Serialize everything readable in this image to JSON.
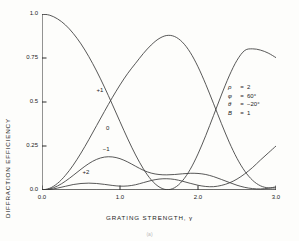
{
  "figure": {
    "caption": "(a)"
  },
  "chart_data": {
    "type": "line",
    "title": "",
    "xlabel": "GRATING STRENGTH, γ",
    "ylabel": "DIFFRACTION EFFICIENCY",
    "xlim": [
      0.0,
      3.0
    ],
    "ylim": [
      0.0,
      1.0
    ],
    "xticks": [
      0.0,
      1.0,
      2.0,
      3.0
    ],
    "xtick_labels": [
      "0.0",
      "1.0",
      "2.0",
      "3.0"
    ],
    "yticks": [
      0.0,
      0.25,
      0.5,
      0.75,
      1.0
    ],
    "ytick_labels": [
      "0.0",
      "0.25",
      "0.5",
      "0.75",
      "1.0"
    ],
    "grid": false,
    "legend_position": "none",
    "x": [
      0.0,
      0.1,
      0.2,
      0.3,
      0.4,
      0.5,
      0.6,
      0.7,
      0.8,
      0.9,
      1.0,
      1.1,
      1.2,
      1.3,
      1.4,
      1.5,
      1.6,
      1.7,
      1.8,
      1.9,
      2.0,
      2.1,
      2.2,
      2.3,
      2.4,
      2.5,
      2.6,
      2.7,
      2.8,
      2.9,
      3.0
    ],
    "series": [
      {
        "name": "0",
        "label": "0",
        "label_x": 0.82,
        "label_y": 0.345,
        "values": [
          1.0,
          0.993,
          0.972,
          0.938,
          0.89,
          0.83,
          0.758,
          0.676,
          0.585,
          0.488,
          0.388,
          0.29,
          0.199,
          0.12,
          0.058,
          0.018,
          0.002,
          0.013,
          0.052,
          0.117,
          0.205,
          0.31,
          0.424,
          0.54,
          0.648,
          0.737,
          0.793,
          0.802,
          0.795,
          0.778,
          0.752
        ]
      },
      {
        "name": "+1",
        "label": "+1",
        "label_x": 0.7,
        "label_y": 0.565,
        "values": [
          0.0,
          0.01,
          0.038,
          0.083,
          0.141,
          0.21,
          0.286,
          0.366,
          0.446,
          0.524,
          0.597,
          0.663,
          0.72,
          0.776,
          0.824,
          0.86,
          0.878,
          0.872,
          0.84,
          0.782,
          0.7,
          0.6,
          0.49,
          0.378,
          0.272,
          0.18,
          0.107,
          0.055,
          0.024,
          0.012,
          0.012
        ]
      },
      {
        "name": "-1",
        "label": "−1",
        "label_x": 0.78,
        "label_y": 0.225,
        "values": [
          0.0,
          0.006,
          0.023,
          0.05,
          0.083,
          0.118,
          0.15,
          0.174,
          0.187,
          0.188,
          0.178,
          0.159,
          0.135,
          0.112,
          0.096,
          0.088,
          0.086,
          0.088,
          0.092,
          0.095,
          0.094,
          0.088,
          0.076,
          0.06,
          0.043,
          0.027,
          0.015,
          0.008,
          0.006,
          0.01,
          0.018
        ]
      },
      {
        "name": "+2",
        "label": "+2",
        "label_x": 0.52,
        "label_y": 0.095,
        "values": [
          0.0,
          0.003,
          0.011,
          0.021,
          0.031,
          0.037,
          0.039,
          0.037,
          0.032,
          0.026,
          0.022,
          0.023,
          0.03,
          0.042,
          0.054,
          0.062,
          0.064,
          0.06,
          0.05,
          0.038,
          0.027,
          0.02,
          0.019,
          0.026,
          0.04,
          0.062,
          0.092,
          0.128,
          0.17,
          0.21,
          0.25
        ]
      },
      {
        "name": "baseline",
        "label": "",
        "label_x": null,
        "label_y": null,
        "values": [
          0.0,
          0.0,
          0.0,
          0.0,
          0.0,
          0.0,
          0.0,
          0.0,
          0.0,
          0.0,
          0.0,
          0.0,
          0.0,
          0.0,
          0.0,
          0.0,
          0.0,
          0.0,
          0.0,
          0.0,
          0.0,
          0.0,
          0.0,
          0.0,
          0.0,
          0.0,
          0.0,
          0.0,
          0.0,
          0.0,
          0.0
        ]
      }
    ],
    "annotations": {
      "parameters": [
        {
          "symbol": "ρ",
          "equals": "=",
          "value": "2"
        },
        {
          "symbol": "φ",
          "equals": "=",
          "value": "60°"
        },
        {
          "symbol": "θ",
          "equals": "=",
          "value": "−20°"
        },
        {
          "symbol": "B",
          "equals": "=",
          "value": "1"
        }
      ]
    },
    "line_color": "#3a3a3a"
  }
}
